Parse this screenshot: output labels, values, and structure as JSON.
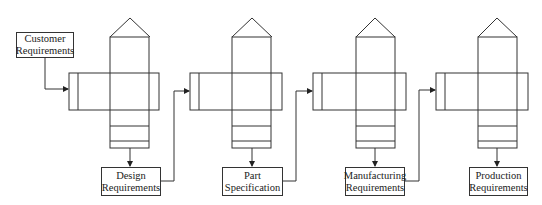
{
  "diagram": {
    "type": "flow",
    "stroke_color": "#333333",
    "input": {
      "lines": [
        "Customer",
        "Requirements"
      ]
    },
    "stages": [
      {
        "x": 69,
        "output": [
          "Design",
          "Requirements"
        ]
      },
      {
        "x": 190,
        "output": [
          "Part",
          "Specification"
        ]
      },
      {
        "x": 313,
        "output": [
          "Manufacturing",
          "Requirements"
        ]
      },
      {
        "x": 436,
        "output": [
          "Production",
          "Requirements"
        ]
      }
    ]
  }
}
